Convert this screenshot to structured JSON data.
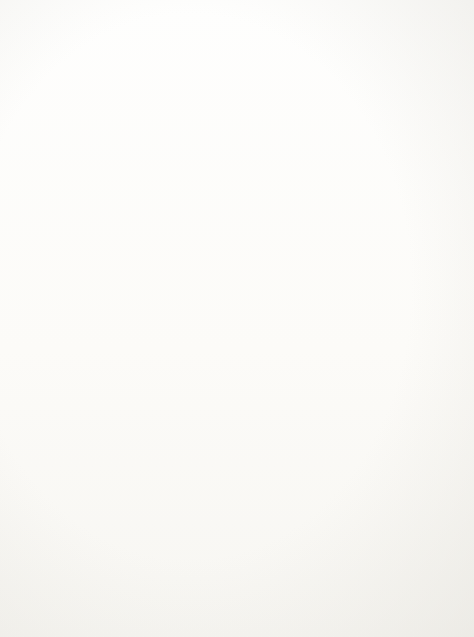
{
  "figure": {
    "caption": "Figure 18.8.  Plan net for a shooting.",
    "caption_label": "Figure 18.8.",
    "caption_text": "Plan net for a shooting.",
    "orientation": "rotated-90-ccw",
    "ink_color": "#141414",
    "page_color": "#fdfdfc"
  },
  "diagram": {
    "type": "plan-net",
    "nodes": [
      {
        "id": "goal",
        "lines": [
          "victim",
          "cause-to-be",
          "dead"
        ],
        "cx": 60,
        "cy": 316,
        "w": 44,
        "h": 72
      },
      {
        "id": "shoot-victim",
        "lines": [
          "actor",
          "shoot",
          "victim"
        ],
        "cx": 150,
        "cy": 322,
        "w": 40,
        "h": 62
      },
      {
        "id": "fire-gun",
        "lines": [
          "actor",
          "fire",
          "gun"
        ],
        "cx": 225,
        "cy": 72,
        "w": 40,
        "h": 52
      },
      {
        "id": "pull-trigger",
        "lines": [
          "actor",
          "pull",
          "trigger"
        ],
        "cx": 338,
        "cy": 72,
        "w": 40,
        "h": 56
      },
      {
        "id": "pull-finger",
        "lines": [
          "actor",
          "pull",
          "finger"
        ],
        "cx": 428,
        "cy": 38,
        "w": 40,
        "h": 52
      },
      {
        "id": "finger-trigger",
        "lines": [
          "actor",
          "finger",
          "trigger"
        ],
        "cx": 428,
        "cy": 108,
        "w": 40,
        "h": 56
      },
      {
        "id": "aim-at-victim",
        "lines": [
          "actor",
          "aim.at",
          "victim"
        ],
        "cx": 232,
        "cy": 238,
        "w": 40,
        "h": 54
      },
      {
        "id": "monitor-outcome",
        "lines": [
          "actor",
          "monitor",
          "outcome"
        ],
        "cx": 328,
        "cy": 180,
        "w": 40,
        "h": 58
      },
      {
        "id": "shoulder-gun",
        "lines": [
          "actor",
          "shoulder",
          "gun"
        ],
        "cx": 328,
        "cy": 239,
        "w": 40,
        "h": 58
      },
      {
        "id": "find-victim",
        "lines": [
          "actor",
          "find",
          "victim"
        ],
        "cx": 328,
        "cy": 300,
        "w": 40,
        "h": 52
      },
      {
        "id": "load-gun",
        "lines": [
          "actor",
          "load",
          "gun"
        ],
        "cx": 232,
        "cy": 465,
        "w": 38,
        "h": 48
      },
      {
        "id": "insert-bullets",
        "lines": [
          "actor",
          "insert",
          "bullets"
        ],
        "cx": 330,
        "cy": 418,
        "w": 40,
        "h": 56
      },
      {
        "id": "get-bullets",
        "lines": [
          "actor",
          "get",
          "bullets"
        ],
        "cx": 330,
        "cy": 512,
        "w": 40,
        "h": 54
      },
      {
        "id": "get-gun",
        "lines": [
          "actor",
          "get",
          "gun"
        ],
        "cx": 232,
        "cy": 591,
        "w": 38,
        "h": 46
      }
    ],
    "edges": [
      {
        "id": "goal-to-shoot",
        "from": "goal",
        "to": "shoot-victim"
      },
      {
        "id": "shoot-to-fire-gun",
        "from": "shoot-victim",
        "to": "fire-gun"
      },
      {
        "id": "shoot-to-aim-at-victim",
        "from": "shoot-victim",
        "to": "aim-at-victim"
      },
      {
        "id": "shoot-to-load-gun",
        "from": "shoot-victim",
        "to": "load-gun"
      },
      {
        "id": "shoot-to-get-gun",
        "from": "shoot-victim",
        "to": "get-gun"
      },
      {
        "id": "fire-gun-to-pull-trigger",
        "from": "fire-gun",
        "to": "pull-trigger"
      },
      {
        "id": "pull-trigger-to-pull-finger",
        "from": "pull-trigger",
        "to": "pull-finger"
      },
      {
        "id": "pull-trigger-to-finger-trigger",
        "from": "pull-trigger",
        "to": "finger-trigger"
      },
      {
        "id": "aim-to-monitor-outcome",
        "from": "aim-at-victim",
        "to": "monitor-outcome"
      },
      {
        "id": "aim-to-shoulder-gun",
        "from": "aim-at-victim",
        "to": "shoulder-gun"
      },
      {
        "id": "aim-to-find-victim",
        "from": "aim-at-victim",
        "to": "find-victim"
      },
      {
        "id": "load-to-insert-bullets",
        "from": "load-gun",
        "to": "insert-bullets"
      },
      {
        "id": "load-to-get-bullets",
        "from": "load-gun",
        "to": "get-bullets"
      }
    ]
  }
}
